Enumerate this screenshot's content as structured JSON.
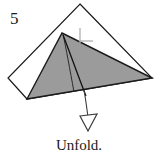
{
  "figure": {
    "step_number": "5",
    "caption": "Unfold.",
    "colors": {
      "paper_front": "#9b9b9b",
      "paper_back": "#ffffff",
      "outline": "#1a1a1a",
      "crease_line": "#262626",
      "crosshair": "#b0b0b0",
      "arrow": "#3a3a3a",
      "text": "#1a1a1a",
      "background": "#ffffff"
    },
    "shapes": {
      "outer_flap": {
        "name": "white-back-layer",
        "points": "80,4 152,78 27,99 8,78"
      },
      "gray_flap": {
        "name": "gray-front-layer",
        "points": "62,33 152,78 27,99"
      },
      "crease_curve_outer": {
        "name": "crease-curve-outer",
        "path": "M 63,34 C 66,48 70,70 74,92"
      },
      "crease_curve_inner": {
        "name": "crease-curve-inner",
        "path": "M 63,35 C 69,50 78,76 86,96"
      },
      "crosshair": {
        "name": "reference-crosshair",
        "vertical": "80,28 80,43",
        "horizontal": "80,41 93,41"
      },
      "arrow": {
        "name": "unfold-arrow",
        "shaft_path": "M 84,90 C 86,101 87,110 88,117",
        "head_points": "80,116 97,114 88,131"
      }
    },
    "labels": {
      "step_number_pos": {
        "x": 10,
        "y": 24
      },
      "caption_pos": {
        "x": 79,
        "y": 150
      }
    }
  }
}
